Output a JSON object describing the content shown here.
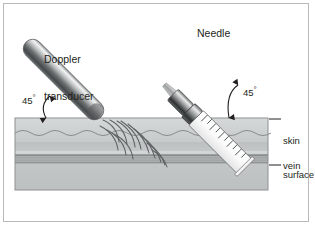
{
  "figure": {
    "width": 315,
    "height": 228,
    "background": "#ffffff",
    "border_color": "#b9b9b9"
  },
  "labels": {
    "doppler_line1": "Doppler",
    "doppler_line2": "transducer",
    "needle": "Needle",
    "angle_left": "45",
    "angle_right": "45",
    "degree_symbol": "°",
    "skin_line1": "skin",
    "skin_line2": "surface",
    "vein": "vein"
  },
  "tissue": {
    "epidermis_color": "#cfd2d3",
    "dermis_color": "#b9bdbe",
    "subcutaneous_color": "#c2c5c6",
    "deep_color": "#bcbfc0",
    "outline_color": "#8d9091",
    "wavy_line_color": "#8a8d8e",
    "block_left": 15,
    "block_right": 268,
    "block_top": 118,
    "block_bottom": 190
  },
  "vein": {
    "wall_color": "#8e9293",
    "lumen_color": "#a9adae",
    "top": 153,
    "bottom": 163
  },
  "transducer": {
    "angle_degrees": 45,
    "body_light": "#f2f2f2",
    "body_mid": "#6e7172",
    "body_dark": "#3f4243",
    "contact_x": 100,
    "contact_y": 118
  },
  "needle": {
    "angle_degrees": 45,
    "barrel_color": "#ededed",
    "hub_dark": "#2e3132",
    "shaft_color": "#9a9d9e",
    "graduation_count": 10,
    "entry_x": 196,
    "entry_y": 118,
    "tip_x": 226,
    "tip_y": 158
  },
  "ultrasound_waves": {
    "color": "#5f6263",
    "arc_count": 9,
    "origin_x": 104,
    "origin_y": 121
  }
}
